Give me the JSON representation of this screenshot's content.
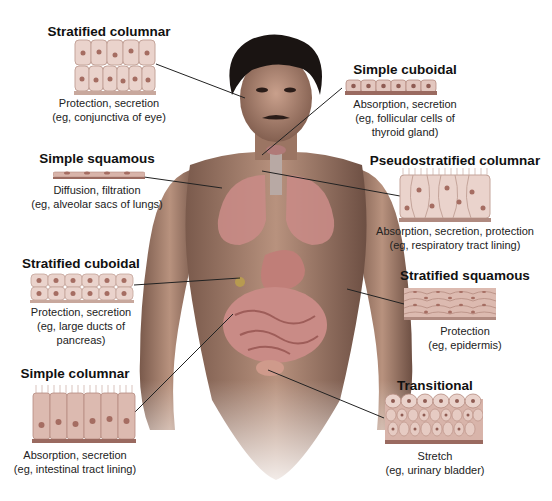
{
  "diagram": {
    "colors": {
      "cell_fill": "#ead3cc",
      "cell_border": "#b58b80",
      "nucleus": "#a56d62",
      "cell_base": "#9a6a60",
      "skin": "#b78f79",
      "hair": "#1a1412",
      "organ": "#c98b86",
      "connector": "#222222"
    },
    "tissues": [
      {
        "id": "stratified-columnar",
        "title": "Stratified columnar",
        "function": "Protection, secretion",
        "example_lines": [
          "(eg, conjunctiva of eye)"
        ],
        "points_to": "eye"
      },
      {
        "id": "simple-cuboidal",
        "title": "Simple cuboidal",
        "function": "Absorption, secretion",
        "example_lines": [
          "(eg, follicular cells of",
          "thyroid gland)"
        ],
        "points_to": "thyroid gland"
      },
      {
        "id": "simple-squamous",
        "title": "Simple squamous",
        "function": "Diffusion, filtration",
        "example_lines": [
          "(eg, alveolar sacs of lungs)"
        ],
        "points_to": "lungs"
      },
      {
        "id": "pseudostratified-columnar",
        "title": "Pseudostratified columnar",
        "function": "Absorption, secretion, protection",
        "example_lines": [
          "(eg, respiratory tract lining)"
        ],
        "points_to": "trachea"
      },
      {
        "id": "stratified-cuboidal",
        "title": "Stratified cuboidal",
        "function": "Protection, secretion",
        "example_lines": [
          "(eg, large ducts of",
          "pancreas)"
        ],
        "points_to": "pancreas"
      },
      {
        "id": "stratified-squamous",
        "title": "Stratified squamous",
        "function": "Protection",
        "example_lines": [
          "(eg, epidermis)"
        ],
        "points_to": "skin of arm"
      },
      {
        "id": "simple-columnar",
        "title": "Simple columnar",
        "function": "Absorption, secretion",
        "example_lines": [
          "(eg, intestinal tract lining)"
        ],
        "points_to": "intestine"
      },
      {
        "id": "transitional",
        "title": "Transitional",
        "function": "Stretch",
        "example_lines": [
          "(eg, urinary bladder)"
        ],
        "points_to": "urinary bladder"
      }
    ]
  }
}
